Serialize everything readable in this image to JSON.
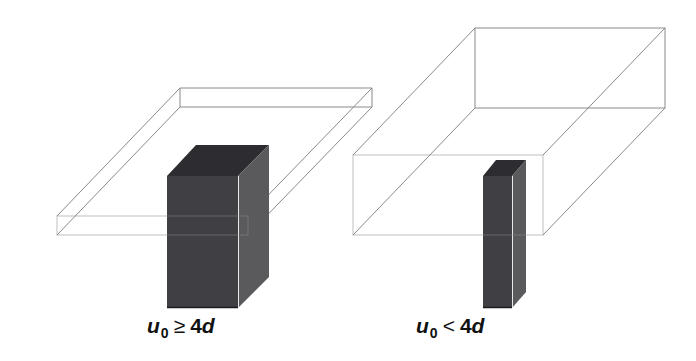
{
  "figure": {
    "panels": [
      {
        "id": "left",
        "caption": {
          "variable": "u",
          "subscript": "0",
          "operator": "≥",
          "coefficient": "4",
          "symbol": "d"
        },
        "slab": "thin slab (wide plan, small depth)",
        "column": "wide column"
      },
      {
        "id": "right",
        "caption": {
          "variable": "u",
          "subscript": "0",
          "operator": "<",
          "coefficient": "4",
          "symbol": "d"
        },
        "slab": "thick slab (deep box)",
        "column": "narrow column"
      }
    ],
    "colors": {
      "edge": "#8a8a8a",
      "column_front": "#3f3f44",
      "column_side": "#5a5a5c",
      "column_top": "#2c2c31",
      "background": "#ffffff"
    }
  }
}
